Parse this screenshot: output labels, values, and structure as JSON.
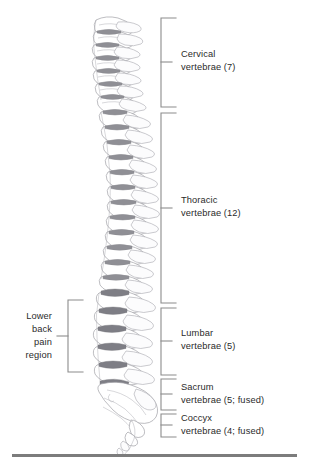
{
  "figure": {
    "type": "anatomical-illustration",
    "line_color": "#9a9aa0",
    "disc_color": "#8d8d93",
    "bracket_color": "#8c8c8c",
    "text_color": "#2b2b2b",
    "rule_color": "#7c7c7c"
  },
  "labels": {
    "cervical": {
      "line1": "Cervical",
      "line2": "vertebrae (7)"
    },
    "thoracic": {
      "line1": "Thoracic",
      "line2": "vertebrae (12)"
    },
    "lumbar": {
      "line1": "Lumbar",
      "line2": "vertebrae (5)"
    },
    "sacrum": {
      "line1": "Sacrum",
      "line2": "vertebrae (5; fused)"
    },
    "coccyx": {
      "line1": "Coccyx",
      "line2": "vertebrae (4; fused)"
    },
    "lower_back_pain": {
      "line1": "Lower",
      "line2": "back",
      "line3": "pain",
      "line4": "region"
    }
  },
  "regions": [
    {
      "name": "cervical",
      "count": 7,
      "fused": false
    },
    {
      "name": "thoracic",
      "count": 12,
      "fused": false
    },
    {
      "name": "lumbar",
      "count": 5,
      "fused": false
    },
    {
      "name": "sacrum",
      "count": 5,
      "fused": true
    },
    {
      "name": "coccyx",
      "count": 4,
      "fused": true
    }
  ]
}
